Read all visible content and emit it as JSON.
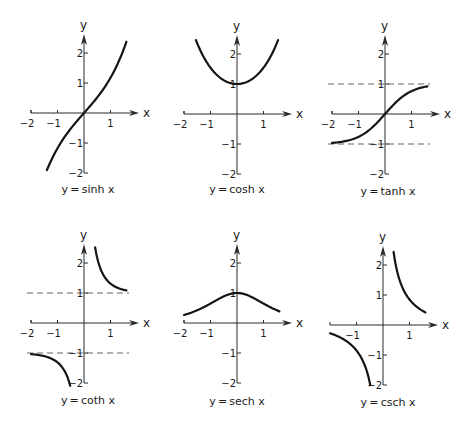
{
  "chart_data": [
    {
      "type": "line",
      "title": "y=sinh x",
      "function": "sinh",
      "xlabel": "x",
      "ylabel": "y",
      "xlim": [
        -2,
        1.7
      ],
      "ylim": [
        -2,
        2.5
      ],
      "xticks": [
        -2,
        -1,
        1
      ],
      "yticks": [
        2,
        1,
        -1,
        -2
      ],
      "domain": [
        [
          -1.4,
          1.6
        ]
      ],
      "asymptotes": [],
      "samples": {
        "x": [
          -1.4,
          -1,
          -0.5,
          0,
          0.5,
          1,
          1.5
        ],
        "y": [
          -1.9,
          -1.18,
          -0.52,
          0,
          0.52,
          1.18,
          2.13
        ]
      }
    },
    {
      "type": "line",
      "title": "y=cosh x",
      "function": "cosh",
      "xlabel": "x",
      "ylabel": "y",
      "xlim": [
        -2,
        1.7
      ],
      "ylim": [
        -2,
        2.5
      ],
      "xticks": [
        -2,
        -1,
        1
      ],
      "yticks": [
        2,
        1,
        -1,
        -2
      ],
      "domain": [
        [
          -1.55,
          1.55
        ]
      ],
      "asymptotes": [],
      "samples": {
        "x": [
          -1.5,
          -1,
          -0.5,
          0,
          0.5,
          1,
          1.5
        ],
        "y": [
          2.35,
          1.54,
          1.13,
          1,
          1.13,
          1.54,
          2.35
        ]
      }
    },
    {
      "type": "line",
      "title": "y=tanh x",
      "function": "tanh",
      "xlabel": "x",
      "ylabel": "y",
      "xlim": [
        -2,
        1.7
      ],
      "ylim": [
        -2,
        2.5
      ],
      "xticks": [
        -2,
        -1,
        1
      ],
      "yticks": [
        2,
        1,
        -1,
        -2
      ],
      "domain": [
        [
          -2,
          1.6
        ]
      ],
      "asymptotes": [
        1,
        -1
      ],
      "samples": {
        "x": [
          -2,
          -1,
          -0.5,
          0,
          0.5,
          1,
          1.5
        ],
        "y": [
          -0.96,
          -0.76,
          -0.46,
          0,
          0.46,
          0.76,
          0.91
        ]
      }
    },
    {
      "type": "line",
      "title": "y=coth x",
      "function": "coth",
      "xlabel": "x",
      "ylabel": "y",
      "xlim": [
        -2,
        1.7
      ],
      "ylim": [
        -2,
        2.5
      ],
      "xticks": [
        -2,
        -1,
        1
      ],
      "yticks": [
        2,
        1,
        -1,
        -2
      ],
      "domain": [
        [
          -2,
          -0.52
        ],
        [
          0.42,
          1.6
        ]
      ],
      "asymptotes": [
        1,
        -1
      ],
      "samples": {
        "x": [
          -2,
          -1,
          -0.55,
          0.45,
          0.5,
          1,
          1.5
        ],
        "y": [
          -1.04,
          -1.31,
          -2.0,
          2.37,
          2.16,
          1.31,
          1.1
        ]
      }
    },
    {
      "type": "line",
      "title": "y=sech x",
      "function": "sech",
      "xlabel": "x",
      "ylabel": "y",
      "xlim": [
        -2,
        1.7
      ],
      "ylim": [
        -2,
        2.5
      ],
      "xticks": [
        -2,
        -1,
        1
      ],
      "yticks": [
        2,
        1,
        -1,
        -2
      ],
      "domain": [
        [
          -2,
          1.6
        ]
      ],
      "asymptotes": [],
      "samples": {
        "x": [
          -2,
          -1,
          -0.5,
          0,
          0.5,
          1,
          1.5
        ],
        "y": [
          0.27,
          0.65,
          0.89,
          1,
          0.89,
          0.65,
          0.43
        ]
      }
    },
    {
      "type": "line",
      "title": "y=csch x",
      "function": "csch",
      "xlabel": "x",
      "ylabel": "y",
      "xlim": [
        -2,
        1.7
      ],
      "ylim": [
        -2,
        2.5
      ],
      "xticks": [
        -1,
        1
      ],
      "yticks": [
        2,
        1,
        -1,
        -2
      ],
      "domain": [
        [
          -2,
          -0.48
        ],
        [
          0.4,
          1.6
        ]
      ],
      "asymptotes": [],
      "samples": {
        "x": [
          -2,
          -1,
          -0.5,
          0.4,
          0.5,
          1,
          1.5
        ],
        "y": [
          -0.28,
          -0.85,
          -1.92,
          2.43,
          1.92,
          0.85,
          0.47
        ]
      }
    }
  ],
  "layout": {
    "panels": [
      {
        "origin": [
          84,
          113
        ],
        "caption_pos": [
          88,
          193
        ]
      },
      {
        "origin": [
          237,
          114
        ],
        "caption_pos": [
          237,
          193
        ]
      },
      {
        "origin": [
          385,
          114
        ],
        "caption_pos": [
          388,
          195
        ]
      },
      {
        "origin": [
          84,
          323
        ],
        "caption_pos": [
          88,
          404
        ]
      },
      {
        "origin": [
          237,
          323
        ],
        "caption_pos": [
          237,
          405
        ]
      },
      {
        "origin": [
          383,
          325
        ],
        "caption_pos": [
          388,
          406
        ]
      }
    ],
    "x_unit_px": 26.5,
    "y_unit_px": 30,
    "colors": {
      "ink": "#151515",
      "axis": "#2a2a2a",
      "dash": "#555555",
      "background": "#ffffff"
    }
  }
}
